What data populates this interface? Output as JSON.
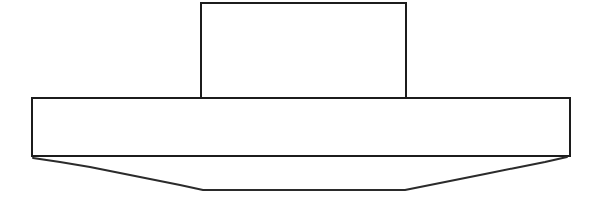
{
  "figure": {
    "background_color": "#ffffff",
    "stroke_color": "#1c1c1c",
    "deflection_stroke_color": "#2b2b2b",
    "stroke_width": 2,
    "canvas": {
      "width": 593,
      "height": 203
    },
    "shapes": [
      {
        "name": "web-rectangle",
        "label": "upper vertical rectangle (web)",
        "type": "rectangle",
        "x": 201,
        "y": 3,
        "width": 205,
        "height": 95,
        "points": "201,98 201,3 406,3 406,98"
      },
      {
        "name": "flange-rectangle",
        "label": "lower horizontal rectangle (flange)",
        "type": "rectangle",
        "x": 32,
        "y": 98,
        "width": 538,
        "height": 58,
        "points": "32,156 32,98 570,98 570,156 32,156"
      },
      {
        "name": "deflection-curve",
        "label": "deflected lower boundary",
        "type": "polyline",
        "points": "33,158 60,162 90,167 120,173 150,179 180,185 203,190 405,190 425,186 455,180 485,174 515,168 545,162 567,157"
      }
    ]
  }
}
